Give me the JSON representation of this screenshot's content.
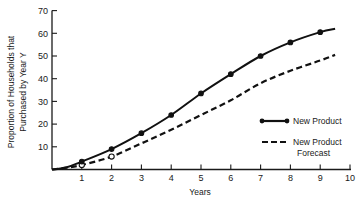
{
  "chart_data": {
    "type": "line",
    "title": "",
    "xlabel": "Years",
    "ylabel": [
      "Proportion of Households that",
      "Purchased by Year Y"
    ],
    "xlim": [
      0,
      10
    ],
    "ylim": [
      0,
      70
    ],
    "x_ticks": [
      1,
      2,
      3,
      4,
      5,
      6,
      7,
      8,
      9,
      10
    ],
    "y_ticks": [
      10,
      20,
      30,
      40,
      50,
      60,
      70
    ],
    "grid": false,
    "legend_position": "right-middle",
    "series": [
      {
        "name": "New Product",
        "style": "solid",
        "marker": "filled-circle",
        "x": [
          0,
          0.5,
          1,
          2,
          3,
          4,
          5,
          6,
          7,
          8,
          9,
          9.5
        ],
        "y": [
          0,
          1,
          3.5,
          9,
          16,
          24,
          33.5,
          42,
          50,
          56,
          60.5,
          62
        ],
        "marker_x": [
          1,
          2,
          3,
          4,
          5,
          6,
          7,
          8,
          9
        ]
      },
      {
        "name": "New Product Forecast",
        "style": "dashed",
        "marker": "open-circle",
        "x": [
          0,
          0.5,
          1,
          2,
          3,
          4,
          5,
          6,
          7,
          8,
          9,
          9.5
        ],
        "y": [
          0,
          0.8,
          2,
          5.7,
          11.5,
          17.5,
          24,
          30.5,
          38,
          43.5,
          48,
          50.5
        ],
        "marker_x": [
          1,
          2
        ]
      }
    ]
  },
  "legend": {
    "items": [
      {
        "label_lines": [
          "New Product"
        ]
      },
      {
        "label_lines": [
          "New Product",
          "Forecast"
        ]
      }
    ]
  }
}
